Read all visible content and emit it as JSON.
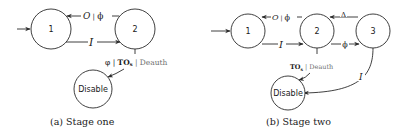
{
  "figure": {
    "panels": [
      {
        "id": "a",
        "caption": "(a) Stage one",
        "nodes": [
          {
            "id": "1",
            "label": "1"
          },
          {
            "id": "2",
            "label": "2"
          },
          {
            "id": "disable",
            "label": "Disable"
          }
        ],
        "edges": [
          {
            "from": "start",
            "to": "1",
            "label": ""
          },
          {
            "from": "1",
            "to": "2",
            "label": "I"
          },
          {
            "from": "2",
            "to": "1",
            "label_main": "O",
            "label_sep": " | ",
            "label_out": "ϕ"
          },
          {
            "from": "2",
            "to": "disable",
            "label_a": "φ | ",
            "label_b": "TO",
            "label_sub": "s",
            "label_c": " | Deauth"
          }
        ]
      },
      {
        "id": "b",
        "caption": "(b) Stage two",
        "nodes": [
          {
            "id": "1",
            "label": "1"
          },
          {
            "id": "2",
            "label": "2"
          },
          {
            "id": "3",
            "label": "3"
          },
          {
            "id": "disable",
            "label": "Disable"
          }
        ],
        "edges": [
          {
            "from": "start",
            "to": "1",
            "label": ""
          },
          {
            "from": "1",
            "to": "2",
            "label": "I"
          },
          {
            "from": "2",
            "to": "1",
            "label_main": "O",
            "label_sep": " | ",
            "label_out": "ϕ"
          },
          {
            "from": "2",
            "to": "3",
            "label": "ϕ"
          },
          {
            "from": "3",
            "to": "2",
            "label": "Δ"
          },
          {
            "from": "3",
            "to": "disable",
            "label": "I"
          },
          {
            "from": "2",
            "to": "disable",
            "label_b": "TO",
            "label_sub": "s",
            "label_c": " | Deauth"
          }
        ]
      }
    ]
  }
}
